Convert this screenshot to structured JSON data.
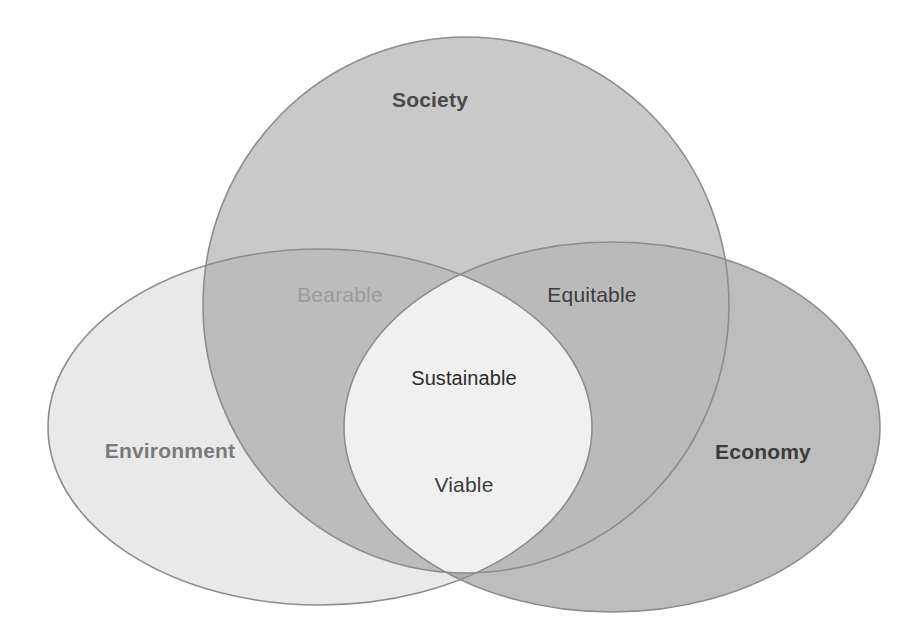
{
  "diagram": {
    "background_color": "#ffffff",
    "stroke_color": "#8d8d8d",
    "stroke_width": 1.6
  },
  "sets": [
    {
      "key": "society",
      "label": "Society",
      "fill": "#c9c9c9",
      "text_color": "#4a4a4a",
      "cx": 466,
      "cy": 305,
      "rx": 263,
      "ry": 268,
      "label_x": 430,
      "label_y": 100
    },
    {
      "key": "environment",
      "label": "Environment",
      "fill": "#e9e9e9",
      "text_color": "#7a7a7a",
      "cx": 320,
      "cy": 427,
      "rx": 272,
      "ry": 178,
      "label_x": 170,
      "label_y": 451
    },
    {
      "key": "economy",
      "label": "Economy",
      "fill": "#bdbdbd",
      "text_color": "#3c3c3c",
      "cx": 612,
      "cy": 427,
      "rx": 268,
      "ry": 185,
      "label_x": 763,
      "label_y": 452
    }
  ],
  "overlaps": [
    {
      "key": "bearable",
      "label": "Bearable",
      "sets": [
        "society",
        "environment"
      ],
      "fill": "#bcbcbc",
      "text_color": "#9b9b9b",
      "label_x": 340,
      "label_y": 295
    },
    {
      "key": "equitable",
      "label": "Equitable",
      "sets": [
        "society",
        "economy"
      ],
      "fill": "#bababa",
      "text_color": "#3c3c3c",
      "label_x": 592,
      "label_y": 295
    },
    {
      "key": "viable",
      "label": "Viable",
      "sets": [
        "environment",
        "economy"
      ],
      "fill": "#b0b0b0",
      "text_color": "#3c3c3c",
      "label_x": 464,
      "label_y": 485
    }
  ],
  "core": {
    "key": "sustainable",
    "label": "Sustainable",
    "sets": [
      "society",
      "environment",
      "economy"
    ],
    "fill": "#f0f0f0",
    "text_color": "#2b2b2b",
    "label_x": 464,
    "label_y": 378
  }
}
